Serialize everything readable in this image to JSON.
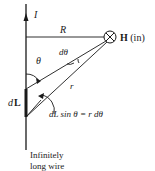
{
  "diagram": {
    "current_label": "I",
    "perpendicular_distance_label": "R",
    "field_point_label_bold": "H",
    "field_point_label_suffix": " (in)",
    "angle_label": "θ",
    "dtheta_label": "dθ",
    "distance_label": "r",
    "element_label_d": "d",
    "element_label_L": "L",
    "relation_label": "dL sin θ = r dθ",
    "wire_caption_line1": "Infinitely",
    "wire_caption_line2": "long wire",
    "stroke_color": "#1a1a1a"
  }
}
